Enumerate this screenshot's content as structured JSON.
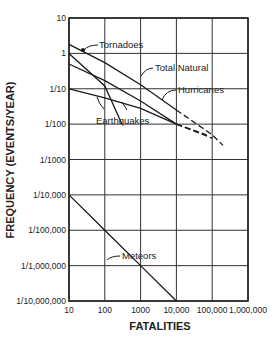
{
  "chart_data": {
    "type": "line",
    "title": "",
    "xlabel": "FATALITIES",
    "ylabel": "FREQUENCY (EVENTS/YEAR)",
    "xscale": "log",
    "yscale": "log",
    "xlim": [
      10,
      1000000
    ],
    "ylim": [
      1e-07,
      10
    ],
    "grid": true,
    "legend": "inline labels with leader arrows",
    "x_tick_labels": [
      "10",
      "100",
      "1000",
      "10,000",
      "100,000",
      "1,000,000"
    ],
    "x_tick_values": [
      10,
      100,
      1000,
      10000,
      100000,
      1000000
    ],
    "y_tick_labels": [
      "10",
      "1",
      "1/10",
      "1/100",
      "1/1000",
      "1/10,000",
      "1/100,000",
      "1/1,000,000",
      "1/10,000,000"
    ],
    "y_tick_values": [
      10,
      1,
      0.1,
      0.01,
      0.001,
      0.0001,
      1e-05,
      1e-06,
      1e-07
    ],
    "series": [
      {
        "name": "Total Natural",
        "x": [
          10,
          100,
          1000,
          10000,
          100000,
          200000
        ],
        "y": [
          1.8,
          0.55,
          0.13,
          0.025,
          0.005,
          0.0025
        ],
        "dashed_beyond": 10000
      },
      {
        "name": "Tornadoes",
        "x": [
          10,
          100,
          300
        ],
        "y": [
          1.0,
          0.12,
          0.01
        ]
      },
      {
        "name": "Hurricanes",
        "x": [
          10,
          100,
          1000,
          10000,
          100000
        ],
        "y": [
          0.5,
          0.17,
          0.045,
          0.01,
          0.004
        ],
        "dashed_beyond": 10000
      },
      {
        "name": "Earthquakes",
        "x": [
          10,
          100,
          1000,
          10000,
          70000
        ],
        "y": [
          0.1,
          0.055,
          0.028,
          0.01,
          0.005
        ],
        "dashed_beyond": 10000
      },
      {
        "name": "Meteors",
        "x": [
          10,
          100,
          1000,
          10000
        ],
        "y": [
          0.0001,
          1e-05,
          1e-06,
          1e-07
        ]
      }
    ]
  },
  "labels": {
    "tornadoes": "Tornadoes",
    "total_natural": "Total Natural",
    "hurricanes": "Hurricanes",
    "earthquakes": "Earthquakes",
    "meteors": "Meteors"
  }
}
